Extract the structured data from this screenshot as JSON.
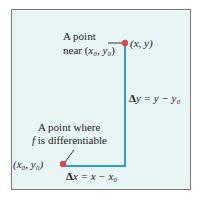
{
  "diagram": {
    "point_near": {
      "label_line1": "A point",
      "label_line2_prefix": "near (",
      "label_line2_math": "x₀, y₀",
      "label_line2_suffix": ")",
      "coord_label": "(x, y)"
    },
    "point_base": {
      "label_line1": "A point where",
      "label_line2_f": "f",
      "label_line2_rest": " is differentiable",
      "coord_label": "(x₀, y₀)"
    },
    "delta_y": {
      "delta": "Δ",
      "expr": "y = y − y₀"
    },
    "delta_x": {
      "delta": "Δ",
      "expr": "x = x − x₀"
    },
    "colors": {
      "line": "#2a9fd6",
      "point": "#e0474c",
      "frame_bg": "#e8f5f5",
      "frame_border": "#7a7a7a"
    }
  }
}
